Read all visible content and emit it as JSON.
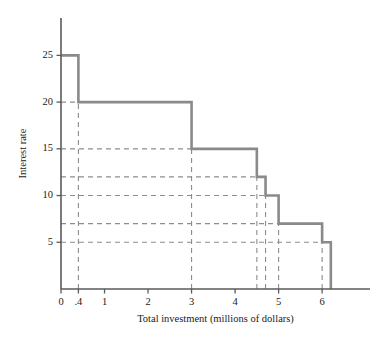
{
  "chart_data": {
    "type": "line",
    "subtype": "step-function",
    "title": "",
    "xlabel": "Total investment (millions of dollars)",
    "ylabel": "Interest rate",
    "xlim": [
      0,
      7.1
    ],
    "ylim": [
      0,
      29
    ],
    "grid": true,
    "grid_style": "dashed",
    "legend": "none",
    "x_ticks": [
      {
        "value": 0,
        "label": "0"
      },
      {
        "value": 0.4,
        "label": ".4"
      },
      {
        "value": 1,
        "label": "1"
      },
      {
        "value": 2,
        "label": "2"
      },
      {
        "value": 3,
        "label": "3"
      },
      {
        "value": 4,
        "label": "4"
      },
      {
        "value": 5,
        "label": "5"
      },
      {
        "value": 6,
        "label": "6"
      }
    ],
    "y_ticks": [
      {
        "value": 5,
        "label": "5"
      },
      {
        "value": 10,
        "label": "10"
      },
      {
        "value": 15,
        "label": "15"
      },
      {
        "value": 20,
        "label": "20"
      },
      {
        "value": 25,
        "label": "25"
      }
    ],
    "y_gridlines": [
      5,
      7,
      10,
      12,
      15,
      20,
      25
    ],
    "x_gridlines": [
      0.4,
      3,
      4.5,
      4.7,
      5,
      6,
      6.2
    ],
    "steps": [
      {
        "rate": 25,
        "x_start": 0,
        "x_end": 0.4
      },
      {
        "rate": 20,
        "x_start": 0.4,
        "x_end": 3
      },
      {
        "rate": 15,
        "x_start": 3,
        "x_end": 4.5
      },
      {
        "rate": 12,
        "x_start": 4.5,
        "x_end": 4.7
      },
      {
        "rate": 10,
        "x_start": 4.7,
        "x_end": 5
      },
      {
        "rate": 7,
        "x_start": 5,
        "x_end": 6
      },
      {
        "rate": 5,
        "x_start": 6,
        "x_end": 6.2
      }
    ],
    "series": [
      {
        "name": "Investment demand schedule",
        "x": [
          0,
          0.4,
          0.4,
          3,
          3,
          4.5,
          4.5,
          4.7,
          4.7,
          5,
          5,
          6,
          6,
          6.2,
          6.2
        ],
        "y": [
          25,
          25,
          20,
          20,
          15,
          15,
          12,
          12,
          10,
          10,
          7,
          7,
          5,
          5,
          0
        ]
      }
    ]
  }
}
